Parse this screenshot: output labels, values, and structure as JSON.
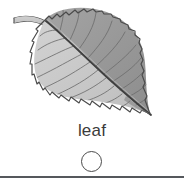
{
  "item": {
    "label": "leaf",
    "illustration_name": "leaf-illustration",
    "illustration_alt": "grayscale drawing of a serrated ovate leaf with a curved stem",
    "bubble_state": "unselected"
  },
  "colors": {
    "background": "#ffffff",
    "label_text": "#3b3b3b",
    "bubble_stroke": "#4a4a4a",
    "divider": "#55585c",
    "leaf_outline": "#4a4a4a",
    "leaf_dark_fill": "#9a9a9a",
    "leaf_light_fill": "#c8c8c8",
    "leaf_midrib": "#3f3f3f",
    "leaf_vein": "#6e6e6e",
    "leaf_stem": "#b5b5b5"
  },
  "geometry": {
    "canvas_width": 184,
    "canvas_height": 189,
    "bubble_diameter": 21,
    "divider_y": 176
  }
}
